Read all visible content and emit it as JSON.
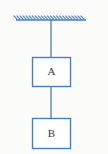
{
  "figure": {
    "background_color": "#fbfbfa",
    "line_color": "#4a7ebb",
    "box_fill_color": "#ffffff",
    "label_color": "#3a3a3a",
    "ceiling": {
      "name": "ceiling-support",
      "x_start": 16,
      "x_end": 86,
      "y": 20,
      "hatch_count": 23,
      "hatch_length": 5,
      "hatch_angle_deg": 45
    },
    "strings": [
      {
        "name": "string-ceiling-to-a",
        "x": 51,
        "y_start": 20,
        "y_end": 57
      },
      {
        "name": "string-a-to-b",
        "x": 51,
        "y_start": 86,
        "y_end": 118
      }
    ],
    "blocks": [
      {
        "name": "block-a",
        "label": "A",
        "x": 32,
        "y": 57,
        "width": 38,
        "height": 29
      },
      {
        "name": "block-b",
        "label": "B",
        "x": 32,
        "y": 118,
        "width": 38,
        "height": 30
      }
    ]
  }
}
